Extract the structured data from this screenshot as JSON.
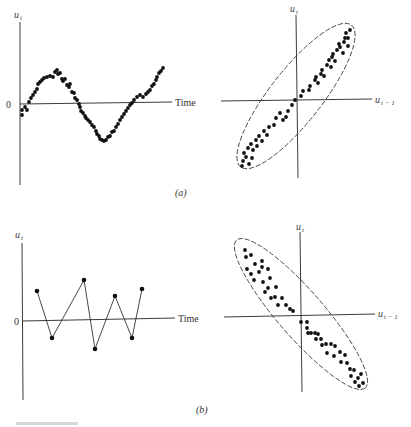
{
  "chart_data": [
    {
      "id": "a-left",
      "type": "scatter",
      "panel": "(a)",
      "ylabel": "u_t",
      "xlabel": "Time",
      "zero_label": "0",
      "description": "Positive autocorrelation: residuals follow a smooth sine-like cyclical pattern over time",
      "points": [
        [
          22,
          115
        ],
        [
          22,
          110
        ],
        [
          25,
          107
        ],
        [
          27,
          110
        ],
        [
          29,
          102
        ],
        [
          31,
          98
        ],
        [
          33,
          95
        ],
        [
          35,
          92
        ],
        [
          37,
          89
        ],
        [
          38,
          84
        ],
        [
          40,
          82
        ],
        [
          42,
          80
        ],
        [
          44,
          78
        ],
        [
          47,
          77
        ],
        [
          50,
          76
        ],
        [
          53,
          77
        ],
        [
          55,
          72
        ],
        [
          57,
          70
        ],
        [
          58,
          74
        ],
        [
          60,
          73
        ],
        [
          62,
          79
        ],
        [
          63,
          81
        ],
        [
          65,
          79
        ],
        [
          67,
          85
        ],
        [
          69,
          87
        ],
        [
          70,
          84
        ],
        [
          72,
          92
        ],
        [
          74,
          93
        ],
        [
          75,
          98
        ],
        [
          77,
          100
        ],
        [
          79,
          104
        ],
        [
          80,
          107
        ],
        [
          81,
          111
        ],
        [
          83,
          113
        ],
        [
          85,
          116
        ],
        [
          86,
          118
        ],
        [
          88,
          120
        ],
        [
          90,
          122
        ],
        [
          92,
          125
        ],
        [
          94,
          127
        ],
        [
          96,
          131
        ],
        [
          97,
          134
        ],
        [
          99,
          136
        ],
        [
          100,
          139
        ],
        [
          102,
          140
        ],
        [
          104,
          141
        ],
        [
          106,
          140
        ],
        [
          108,
          137
        ],
        [
          110,
          136
        ],
        [
          112,
          132
        ],
        [
          114,
          131
        ],
        [
          116,
          127
        ],
        [
          118,
          124
        ],
        [
          120,
          120
        ],
        [
          122,
          117
        ],
        [
          124,
          114
        ],
        [
          126,
          111
        ],
        [
          128,
          108
        ],
        [
          130,
          105
        ],
        [
          132,
          103
        ],
        [
          134,
          100
        ],
        [
          137,
          97
        ],
        [
          140,
          95
        ],
        [
          143,
          97
        ],
        [
          146,
          94
        ],
        [
          148,
          92
        ],
        [
          150,
          90
        ],
        [
          152,
          86
        ],
        [
          154,
          84
        ],
        [
          156,
          80
        ],
        [
          157,
          77
        ],
        [
          159,
          73
        ],
        [
          161,
          71
        ],
        [
          163,
          68
        ]
      ]
    },
    {
      "id": "a-right",
      "type": "scatter",
      "panel": "(a)",
      "ylabel": "u_t",
      "xlabel": "u_{t-1}",
      "description": "Positive autocorrelation: u_t vs u_{t-1} points clustered along an upward-sloping ellipse",
      "ellipse": {
        "cx": 296,
        "cy": 96,
        "rx": 90,
        "ry": 26,
        "angle": -52
      },
      "points": [
        [
          242,
          166
        ],
        [
          243,
          161
        ],
        [
          246,
          157
        ],
        [
          249,
          164
        ],
        [
          244,
          153
        ],
        [
          248,
          148
        ],
        [
          251,
          144
        ],
        [
          253,
          150
        ],
        [
          252,
          158
        ],
        [
          256,
          140
        ],
        [
          259,
          136
        ],
        [
          262,
          141
        ],
        [
          257,
          146
        ],
        [
          264,
          131
        ],
        [
          267,
          135
        ],
        [
          269,
          127
        ],
        [
          274,
          125
        ],
        [
          276,
          118
        ],
        [
          280,
          113
        ],
        [
          283,
          120
        ],
        [
          286,
          117
        ],
        [
          288,
          111
        ],
        [
          292,
          105
        ],
        [
          295,
          100
        ],
        [
          301,
          96
        ],
        [
          303,
          91
        ],
        [
          309,
          90
        ],
        [
          310,
          86
        ],
        [
          315,
          80
        ],
        [
          316,
          77
        ],
        [
          318,
          83
        ],
        [
          321,
          74
        ],
        [
          322,
          70
        ],
        [
          324,
          76
        ],
        [
          327,
          65
        ],
        [
          329,
          60
        ],
        [
          331,
          67
        ],
        [
          332,
          57
        ],
        [
          333,
          54
        ],
        [
          335,
          61
        ],
        [
          337,
          50
        ],
        [
          340,
          47
        ],
        [
          343,
          53
        ],
        [
          339,
          44
        ],
        [
          344,
          42
        ],
        [
          345,
          38
        ],
        [
          348,
          46
        ],
        [
          350,
          30
        ],
        [
          348,
          38
        ],
        [
          346,
          33
        ]
      ]
    },
    {
      "id": "b-left",
      "type": "line",
      "panel": "(b)",
      "ylabel": "u_t",
      "xlabel": "Time",
      "zero_label": "0",
      "description": "Negative autocorrelation: residuals alternate sign in a zig-zag pattern",
      "points": [
        [
          37,
          291
        ],
        [
          52,
          338
        ],
        [
          84,
          280
        ],
        [
          95,
          349
        ],
        [
          115,
          296
        ],
        [
          132,
          338
        ],
        [
          142,
          289
        ]
      ]
    },
    {
      "id": "b-right",
      "type": "scatter",
      "panel": "(b)",
      "ylabel": "u_t",
      "xlabel": "u_{t-1}",
      "description": "Negative autocorrelation: u_t vs u_{t-1} points clustered along a downward-sloping ellipse",
      "ellipse": {
        "cx": 301,
        "cy": 314,
        "rx": 98,
        "ry": 23,
        "angle": 49
      },
      "points": [
        [
          245,
          250
        ],
        [
          246,
          257
        ],
        [
          251,
          255
        ],
        [
          247,
          269
        ],
        [
          251,
          274
        ],
        [
          255,
          264
        ],
        [
          254,
          280
        ],
        [
          259,
          272
        ],
        [
          262,
          261
        ],
        [
          263,
          282
        ],
        [
          265,
          292
        ],
        [
          262,
          267
        ],
        [
          268,
          269
        ],
        [
          270,
          278
        ],
        [
          268,
          288
        ],
        [
          271,
          298
        ],
        [
          275,
          297
        ],
        [
          276,
          287
        ],
        [
          278,
          305
        ],
        [
          282,
          298
        ],
        [
          286,
          305
        ],
        [
          290,
          309
        ],
        [
          293,
          311
        ],
        [
          301,
          322
        ],
        [
          307,
          322
        ],
        [
          307,
          328
        ],
        [
          308,
          333
        ],
        [
          311,
          333
        ],
        [
          315,
          333
        ],
        [
          316,
          339
        ],
        [
          318,
          334
        ],
        [
          321,
          339
        ],
        [
          322,
          345
        ],
        [
          326,
          344
        ],
        [
          327,
          353
        ],
        [
          331,
          344
        ],
        [
          334,
          356
        ],
        [
          335,
          346
        ],
        [
          340,
          352
        ],
        [
          341,
          362
        ],
        [
          345,
          355
        ],
        [
          347,
          363
        ],
        [
          350,
          369
        ],
        [
          351,
          376
        ],
        [
          354,
          370
        ],
        [
          355,
          382
        ],
        [
          358,
          378
        ],
        [
          359,
          386
        ],
        [
          361,
          374
        ],
        [
          363,
          383
        ]
      ]
    }
  ],
  "captions": {
    "panel_a": "(a)",
    "panel_b": "(b)"
  },
  "labels": {
    "u_t": "u",
    "u_t_sub": "t",
    "u_t1": "u",
    "u_t1_sub": "t − 1",
    "time": "Time",
    "zero": "0"
  }
}
